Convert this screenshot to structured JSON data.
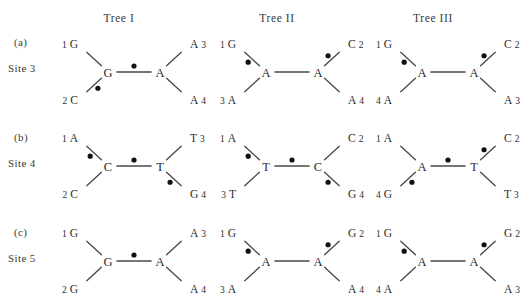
{
  "figure": {
    "background": "#ffffff",
    "line_color": "#4a4a4a",
    "dot_color": "#111111",
    "text_color": "#2b2b2b"
  },
  "columns": [
    {
      "id": "tree-1",
      "label": "Tree I",
      "x": 119
    },
    {
      "id": "tree-2",
      "label": "Tree II",
      "x": 277
    },
    {
      "id": "tree-3",
      "label": "Tree III",
      "x": 433
    }
  ],
  "rows": [
    {
      "id": "row-a",
      "panel": "(a)",
      "site": "Site 3",
      "panel_y": 36,
      "site_y": 62,
      "block_y": 26
    },
    {
      "id": "row-b",
      "panel": "(b)",
      "site": "Site 4",
      "panel_y": 131,
      "site_y": 157,
      "block_y": 120
    },
    {
      "id": "row-c",
      "panel": "(c)",
      "site": "Site 5",
      "panel_y": 226,
      "site_y": 252,
      "block_y": 215
    }
  ],
  "trees": {
    "a1": {
      "caption": "Site 3, Tree I",
      "internal_left": "G",
      "internal_right": "A",
      "tips": {
        "upper_left": {
          "num": "1",
          "base": "G",
          "order": "num-base"
        },
        "lower_left": {
          "num": "2",
          "base": "C",
          "order": "num-base"
        },
        "upper_right": {
          "num": "3",
          "base": "A",
          "order": "base-num"
        },
        "lower_right": {
          "num": "4",
          "base": "A",
          "order": "base-num"
        }
      },
      "mutations": {
        "upper_left": false,
        "lower_left": true,
        "internal": true,
        "upper_right": false,
        "lower_right": false
      },
      "mutation_count": 2
    },
    "a2": {
      "caption": "Site 3, Tree II",
      "internal_left": "A",
      "internal_right": "A",
      "tips": {
        "upper_left": {
          "num": "1",
          "base": "G",
          "order": "num-base"
        },
        "lower_left": {
          "num": "3",
          "base": "A",
          "order": "num-base"
        },
        "upper_right": {
          "num": "2",
          "base": "C",
          "order": "base-num"
        },
        "lower_right": {
          "num": "4",
          "base": "A",
          "order": "base-num"
        }
      },
      "mutations": {
        "upper_left": true,
        "lower_left": false,
        "internal": false,
        "upper_right": true,
        "lower_right": false
      },
      "mutation_count": 2
    },
    "a3": {
      "caption": "Site 3, Tree III",
      "internal_left": "A",
      "internal_right": "A",
      "tips": {
        "upper_left": {
          "num": "1",
          "base": "G",
          "order": "num-base"
        },
        "lower_left": {
          "num": "4",
          "base": "A",
          "order": "num-base"
        },
        "upper_right": {
          "num": "2",
          "base": "C",
          "order": "base-num"
        },
        "lower_right": {
          "num": "3",
          "base": "A",
          "order": "base-num"
        }
      },
      "mutations": {
        "upper_left": true,
        "lower_left": false,
        "internal": false,
        "upper_right": true,
        "lower_right": false
      },
      "mutation_count": 2
    },
    "b1": {
      "caption": "Site 4, Tree I",
      "internal_left": "C",
      "internal_right": "T",
      "tips": {
        "upper_left": {
          "num": "1",
          "base": "A",
          "order": "num-base"
        },
        "lower_left": {
          "num": "2",
          "base": "C",
          "order": "num-base"
        },
        "upper_right": {
          "num": "3",
          "base": "T",
          "order": "base-num"
        },
        "lower_right": {
          "num": "4",
          "base": "G",
          "order": "base-num"
        }
      },
      "mutations": {
        "upper_left": true,
        "lower_left": false,
        "internal": true,
        "upper_right": false,
        "lower_right": true
      },
      "mutation_count": 3
    },
    "b2": {
      "caption": "Site 4, Tree II",
      "internal_left": "T",
      "internal_right": "C",
      "tips": {
        "upper_left": {
          "num": "1",
          "base": "A",
          "order": "num-base"
        },
        "lower_left": {
          "num": "3",
          "base": "T",
          "order": "num-base"
        },
        "upper_right": {
          "num": "2",
          "base": "C",
          "order": "base-num"
        },
        "lower_right": {
          "num": "4",
          "base": "G",
          "order": "base-num"
        }
      },
      "mutations": {
        "upper_left": true,
        "lower_left": false,
        "internal": true,
        "upper_right": false,
        "lower_right": true
      },
      "mutation_count": 3
    },
    "b3": {
      "caption": "Site 4, Tree III",
      "internal_left": "A",
      "internal_right": "T",
      "tips": {
        "upper_left": {
          "num": "1",
          "base": "A",
          "order": "num-base"
        },
        "lower_left": {
          "num": "4",
          "base": "G",
          "order": "num-base"
        },
        "upper_right": {
          "num": "2",
          "base": "C",
          "order": "base-num"
        },
        "lower_right": {
          "num": "3",
          "base": "T",
          "order": "base-num"
        }
      },
      "mutations": {
        "upper_left": false,
        "lower_left": true,
        "internal": true,
        "upper_right": true,
        "lower_right": false
      },
      "mutation_count": 3
    },
    "c1": {
      "caption": "Site 5, Tree I",
      "internal_left": "G",
      "internal_right": "A",
      "tips": {
        "upper_left": {
          "num": "1",
          "base": "G",
          "order": "num-base"
        },
        "lower_left": {
          "num": "2",
          "base": "G",
          "order": "num-base"
        },
        "upper_right": {
          "num": "3",
          "base": "A",
          "order": "base-num"
        },
        "lower_right": {
          "num": "4",
          "base": "A",
          "order": "base-num"
        }
      },
      "mutations": {
        "upper_left": false,
        "lower_left": false,
        "internal": true,
        "upper_right": false,
        "lower_right": false
      },
      "mutation_count": 1
    },
    "c2": {
      "caption": "Site 5, Tree II",
      "internal_left": "A",
      "internal_right": "A",
      "tips": {
        "upper_left": {
          "num": "1",
          "base": "G",
          "order": "num-base"
        },
        "lower_left": {
          "num": "3",
          "base": "A",
          "order": "num-base"
        },
        "upper_right": {
          "num": "2",
          "base": "G",
          "order": "base-num"
        },
        "lower_right": {
          "num": "4",
          "base": "A",
          "order": "base-num"
        }
      },
      "mutations": {
        "upper_left": true,
        "lower_left": false,
        "internal": false,
        "upper_right": true,
        "lower_right": false
      },
      "mutation_count": 2
    },
    "c3": {
      "caption": "Site 5, Tree III",
      "internal_left": "A",
      "internal_right": "A",
      "tips": {
        "upper_left": {
          "num": "1",
          "base": "G",
          "order": "num-base"
        },
        "lower_left": {
          "num": "4",
          "base": "A",
          "order": "num-base"
        },
        "upper_right": {
          "num": "2",
          "base": "G",
          "order": "base-num"
        },
        "lower_right": {
          "num": "3",
          "base": "A",
          "order": "base-num"
        }
      },
      "mutations": {
        "upper_left": true,
        "lower_left": false,
        "internal": false,
        "upper_right": true,
        "lower_right": false
      },
      "mutation_count": 2
    }
  },
  "grid": [
    [
      "a1",
      "a2",
      "a3"
    ],
    [
      "b1",
      "b2",
      "b3"
    ],
    [
      "c1",
      "c2",
      "c3"
    ]
  ],
  "block_x": [
    62,
    220,
    376
  ]
}
